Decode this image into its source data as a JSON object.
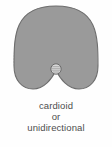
{
  "figure": {
    "background_color": "#fefefe",
    "pattern": {
      "name": "cardioid-polar-pattern",
      "fill_color": "#9a9a9a",
      "stroke_color": "#6e6e6e",
      "capsule": {
        "name": "microphone-capsule",
        "fill_color": "#d8d8d8",
        "stroke_color": "#6b6b6b"
      }
    },
    "caption": {
      "text_color": "#4d4d4d",
      "lines": [
        "cardioid",
        "or",
        "unidirectional"
      ]
    }
  }
}
